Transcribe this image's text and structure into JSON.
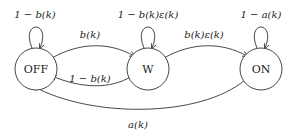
{
  "diagram": {
    "type": "state-machine",
    "nodes": [
      {
        "id": "off",
        "label": "OFF"
      },
      {
        "id": "w",
        "label": "W"
      },
      {
        "id": "on",
        "label": "ON"
      }
    ],
    "edges": [
      {
        "from": "off",
        "to": "off",
        "label": "1 − b(k)"
      },
      {
        "from": "off",
        "to": "w",
        "label": "b(k)"
      },
      {
        "from": "w",
        "to": "w",
        "label": "1 − b(k)ε(k)"
      },
      {
        "from": "w",
        "to": "off",
        "label": "1 − b(k)"
      },
      {
        "from": "w",
        "to": "on",
        "label": "b(k)ε(k)"
      },
      {
        "from": "on",
        "to": "on",
        "label": "1 − a(k)"
      },
      {
        "from": "on",
        "to": "off",
        "label": "a(k)"
      }
    ]
  }
}
